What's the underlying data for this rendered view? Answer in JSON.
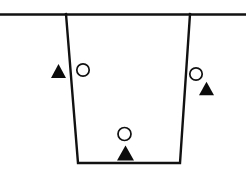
{
  "figure": {
    "background_color": "#ffffff",
    "line_color": "#111111",
    "marker_fill_color": "#0b0b0b",
    "marker_open_color": "#ffffff",
    "width": 246,
    "height": 178
  },
  "ground_surface": {
    "label": "ground-surface-line",
    "x1": 0,
    "y1": 14.5,
    "x2": 246,
    "y2": 14.5
  },
  "excavation": {
    "label": "trench-outline",
    "shape": "trapezoid",
    "points": "66,14 78,163 180,163 190,14",
    "top_left_x": 66,
    "top_right_x": 190,
    "bottom_left_x": 78,
    "bottom_right_x": 180,
    "top_y": 14,
    "bottom_y": 163
  },
  "markers": [
    {
      "group": "left-pair",
      "triangle": {
        "cx": 58.5,
        "cy": 71,
        "half_width": 7.5,
        "height": 14
      },
      "circle": {
        "cx": 83,
        "cy": 70,
        "r": 6.2
      }
    },
    {
      "group": "right-pair",
      "triangle": {
        "cx": 206.5,
        "cy": 88.5,
        "half_width": 7.5,
        "height": 13.5
      },
      "circle": {
        "cx": 196,
        "cy": 74,
        "r": 6.2
      }
    },
    {
      "group": "bottom-pair",
      "triangle": {
        "cx": 125.5,
        "cy": 153,
        "half_width": 8.5,
        "height": 15
      },
      "circle": {
        "cx": 124.5,
        "cy": 134,
        "r": 6.5
      }
    }
  ]
}
